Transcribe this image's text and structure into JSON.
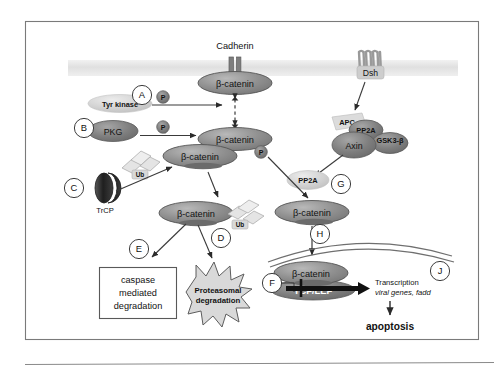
{
  "figure": {
    "title_alt": "Beta-catenin signaling and degradation pathway",
    "colors": {
      "border": "#6f6f6f",
      "membrane": "#e3e3e3",
      "bcatenin_fill": "#8d8d8d",
      "bcatenin_stroke": "#4a4a4a",
      "dark_node": "#6d6d6d",
      "light_node": "#cfcfcf",
      "ub_fill": "#e0e0e0",
      "star_fill": "#d9d9d9",
      "arrow": "#2b2b2b",
      "trcp": "#2a2a2a"
    },
    "membrane": {
      "label": "plasma-membrane"
    },
    "receptors": [
      {
        "id": "cadherin",
        "label": "Cadherin"
      },
      {
        "id": "dsh",
        "label": "Dsh"
      }
    ],
    "nodes": {
      "bcatenin_membrane": "β-catenin",
      "bcatenin_cytosol_upper": "β-catenin",
      "bcatenin_cytosol_left": "β-catenin",
      "bcatenin_ub_tagged": "β-catenin",
      "bcatenin_free": "β-catenin",
      "bcatenin_nuclear": "β-catenin",
      "tyr_kinase": "Tyr kinase",
      "pkg": "PKG",
      "trcp": "TrCP",
      "apc": "APC",
      "pp2a_complex": "PP2A",
      "axin": "Axin",
      "gsk3b": "GSK3-β",
      "pp2a_free": "PP2A",
      "tcf_lef": "TCF/LEF"
    },
    "phosphate_label": "P",
    "ubiquitin_label": "Ub",
    "step_labels": [
      "A",
      "B",
      "C",
      "D",
      "E",
      "F",
      "G",
      "H",
      "J"
    ],
    "outcomes": {
      "caspase_box": [
        "caspase",
        "mediated",
        "degradation"
      ],
      "proteasome_star": [
        "Proteasomal",
        "degradation"
      ],
      "transcription_line1": "Transcription",
      "transcription_line2": "viral genes, fadd",
      "apoptosis": "apoptosis"
    }
  }
}
